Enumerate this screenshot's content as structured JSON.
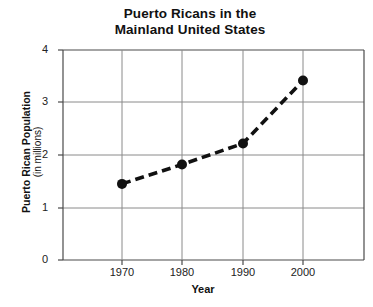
{
  "chart_data": {
    "type": "line",
    "title": "Puerto Ricans in the Mainland United States",
    "title_line1": "Puerto Ricans in the",
    "title_line2": "Mainland United States",
    "xlabel": "Year",
    "ylabel": "Puerto Rican Population",
    "ylabel_sub": "(in millions)",
    "x": [
      1970,
      1980,
      1990,
      2000
    ],
    "values": [
      1.45,
      1.82,
      2.22,
      3.42
    ],
    "categories": [
      "1970",
      "1980",
      "1990",
      "2000"
    ],
    "xtick_labels": [
      "1970",
      "1980",
      "1990",
      "2000"
    ],
    "ytick_labels": [
      "0",
      "1",
      "2",
      "3",
      "4"
    ],
    "ytick_values": [
      0,
      1,
      2,
      3,
      4
    ],
    "ylim": [
      0,
      4
    ],
    "xlim": [
      1960,
      2010
    ],
    "grid": true,
    "legend": "none",
    "line_style": "dashed",
    "line_color": "#111111",
    "marker": "circle",
    "marker_color": "#111111",
    "grid_color": "#8a8a8a",
    "background_color": "#ffffff"
  }
}
